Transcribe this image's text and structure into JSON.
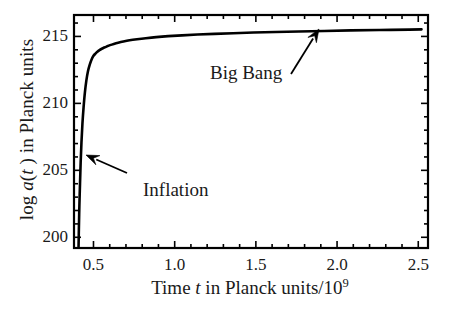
{
  "chart_data": {
    "type": "line",
    "title": "",
    "xlabel": "Time t in Planck units/10⁹",
    "xlabel_parts": {
      "pre": "Time ",
      "italic": "t",
      "mid": " in Planck units/10",
      "sup": "9"
    },
    "ylabel": "log a(t ) in Planck units",
    "ylabel_parts": {
      "pre": "log ",
      "italic_a": "a",
      "paren_open": "(",
      "italic_t": "t",
      "paren_close": " )",
      "post": " in Planck units"
    },
    "xlim": [
      0.38,
      2.56
    ],
    "ylim": [
      199.2,
      216.6
    ],
    "xticks": [
      0.5,
      1.0,
      1.5,
      2.0,
      2.5
    ],
    "xticklabels": [
      "0.5",
      "1.0",
      "1.5",
      "2.0",
      "2.5"
    ],
    "yticks": [
      200,
      205,
      210,
      215
    ],
    "yticklabels": [
      "200",
      "205",
      "210",
      "215"
    ],
    "x_minor_step": 0.1,
    "y_minor_step": 1,
    "grid": false,
    "legend": null,
    "line_color": "#000000",
    "line_width": 2.6,
    "series": [
      {
        "name": "log a(t)",
        "x": [
          0.408,
          0.41,
          0.413,
          0.417,
          0.421,
          0.426,
          0.432,
          0.439,
          0.447,
          0.456,
          0.466,
          0.477,
          0.489,
          0.5,
          0.512,
          0.524,
          0.537,
          0.551,
          0.566,
          0.583,
          0.602,
          0.625,
          0.652,
          0.684,
          0.722,
          0.768,
          0.822,
          0.886,
          0.96,
          1.045,
          1.14,
          1.245,
          1.36,
          1.485,
          1.62,
          1.765,
          1.92,
          2.085,
          2.26,
          2.445,
          2.52
        ],
        "y": [
          199.3,
          200.6,
          202.3,
          204.0,
          205.6,
          207.1,
          208.5,
          209.7,
          210.8,
          211.7,
          212.4,
          212.9,
          213.3,
          213.55,
          213.72,
          213.86,
          213.98,
          214.08,
          214.17,
          214.26,
          214.35,
          214.44,
          214.53,
          214.62,
          214.71,
          214.79,
          214.87,
          214.95,
          215.02,
          215.08,
          215.14,
          215.19,
          215.24,
          215.29,
          215.33,
          215.37,
          215.41,
          215.45,
          215.48,
          215.51,
          215.53
        ]
      }
    ],
    "annotations": [
      {
        "name": "big-bang",
        "text": "Big Bang",
        "text_x": 210,
        "text_y": 63,
        "arrow_tail_x": 291,
        "arrow_tail_y": 74,
        "arrow_head_x": 319,
        "arrow_head_y": 29
      },
      {
        "name": "inflation",
        "text": "Inflation",
        "text_x": 143,
        "text_y": 180,
        "arrow_tail_x": 127,
        "arrow_tail_y": 173,
        "arrow_head_x": 86,
        "arrow_head_y": 155
      }
    ]
  }
}
